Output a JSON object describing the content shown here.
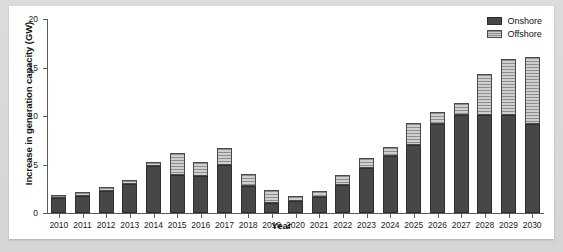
{
  "chart_data": {
    "type": "bar",
    "stacked": true,
    "title": "",
    "xlabel": "Year",
    "ylabel": "Increase in generation capacity (GW)",
    "ylim": [
      0,
      20
    ],
    "yticks": [
      0,
      5,
      10,
      15,
      20
    ],
    "grid": false,
    "legend_position": "top-right",
    "categories": [
      "2010",
      "2011",
      "2012",
      "2013",
      "2014",
      "2015",
      "2016",
      "2017",
      "2018",
      "2019",
      "2020",
      "2021",
      "2022",
      "2023",
      "2024",
      "2025",
      "2026",
      "2027",
      "2028",
      "2029",
      "2030"
    ],
    "series": [
      {
        "name": "Onshore",
        "color": "#474747",
        "values": [
          1.5,
          1.8,
          2.3,
          3.0,
          4.8,
          3.9,
          3.8,
          5.0,
          2.8,
          1.0,
          1.2,
          1.6,
          2.9,
          4.6,
          5.9,
          7.0,
          9.2,
          10.1,
          10.1,
          10.1,
          9.2
        ]
      },
      {
        "name": "Offshore",
        "color": "#b9b9b9",
        "values": [
          0.4,
          0.4,
          0.4,
          0.4,
          0.5,
          2.3,
          1.5,
          1.7,
          1.2,
          1.4,
          0.6,
          0.7,
          1.0,
          1.1,
          0.9,
          2.3,
          1.2,
          1.2,
          4.2,
          5.8,
          6.9
        ]
      }
    ],
    "totals": [
      1.9,
      2.2,
      2.7,
      3.4,
      5.3,
      6.2,
      5.3,
      6.7,
      4.0,
      2.4,
      1.8,
      2.3,
      3.9,
      5.7,
      6.8,
      9.3,
      10.4,
      11.3,
      14.3,
      15.9,
      16.1
    ]
  },
  "legend": {
    "items": [
      {
        "label": "Onshore"
      },
      {
        "label": "Offshore"
      }
    ]
  },
  "colors": {
    "onshore": "#474747",
    "offshore": "#b9b9b9",
    "panel_background": "#ffffff",
    "page_background": "#d9d9d9",
    "axis": "#5b5b5b"
  }
}
